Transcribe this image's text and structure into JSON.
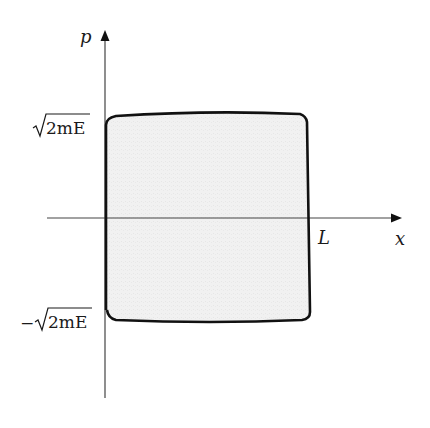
{
  "diagram": {
    "type": "phase-space",
    "axes": {
      "horizontal": {
        "label": "x"
      },
      "vertical": {
        "label": "p"
      }
    },
    "ticks": {
      "p_top": {
        "prefix": "",
        "radicand": "2mE"
      },
      "p_bottom": {
        "prefix": "−",
        "radicand": "2mE"
      },
      "x_right": {
        "label": "L"
      }
    },
    "region": {
      "shape": "rounded-rectangle",
      "x_range": [
        "0",
        "L"
      ],
      "p_range": [
        "−√2mE",
        "√2mE"
      ],
      "fill": "#efefef",
      "stroke": "#111111"
    },
    "colors": {
      "axis": "#444444",
      "boundary": "#111111",
      "fill": "#efefef",
      "text": "#1a1a1a"
    }
  }
}
